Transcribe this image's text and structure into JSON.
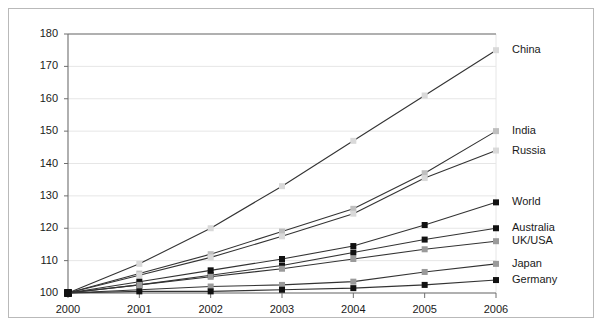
{
  "chart_data": {
    "type": "line",
    "title": "",
    "subtitle": "",
    "xlabel": "",
    "ylabel": "",
    "x": [
      2000,
      2001,
      2002,
      2003,
      2004,
      2005,
      2006
    ],
    "categories": [
      "2000",
      "2001",
      "2002",
      "2003",
      "2004",
      "2005",
      "2006"
    ],
    "xlim": [
      2000,
      2006
    ],
    "ylim": [
      100,
      180
    ],
    "yticks": [
      100,
      110,
      120,
      130,
      140,
      150,
      160,
      170,
      180
    ],
    "ytick_labels": [
      "100",
      "110",
      "120",
      "130",
      "140",
      "150",
      "160",
      "170",
      "180"
    ],
    "xtick_labels": [
      "2000",
      "2001",
      "2002",
      "2003",
      "2004",
      "2005",
      "2006"
    ],
    "grid": "horizontal",
    "legend_position": "right-inline-at-line-end",
    "marker": "square",
    "series": [
      {
        "name": "China",
        "label": "China",
        "color": "#333333",
        "marker_color": "#d9d9d9",
        "values": [
          100,
          109,
          120,
          133,
          147,
          161,
          175
        ]
      },
      {
        "name": "India",
        "label": "India",
        "color": "#333333",
        "marker_color": "#bfbfbf",
        "values": [
          100,
          106,
          112,
          119,
          126,
          137,
          150
        ]
      },
      {
        "name": "Russia",
        "label": "Russia",
        "color": "#333333",
        "marker_color": "#d9d9d9",
        "values": [
          100,
          105.5,
          111,
          117.5,
          124.5,
          135.5,
          144
        ]
      },
      {
        "name": "World",
        "label": "World",
        "color": "#333333",
        "marker_color": "#111111",
        "values": [
          100,
          103.5,
          107,
          110.5,
          114.5,
          121,
          128
        ]
      },
      {
        "name": "Australia",
        "label": "Australia",
        "color": "#333333",
        "marker_color": "#111111",
        "values": [
          100,
          102.5,
          105.5,
          108.5,
          112.5,
          116.5,
          120
        ]
      },
      {
        "name": "UK/USA",
        "label": "UK/USA",
        "color": "#333333",
        "marker_color": "#9a9a9a",
        "values": [
          100,
          102.5,
          105,
          107.5,
          110.5,
          113.5,
          116
        ]
      },
      {
        "name": "Japan",
        "label": "Japan",
        "color": "#333333",
        "marker_color": "#9a9a9a",
        "values": [
          100,
          101,
          102,
          102.5,
          103.5,
          106.5,
          109
        ]
      },
      {
        "name": "Germany",
        "label": "Germany",
        "color": "#333333",
        "marker_color": "#111111",
        "values": [
          100,
          100.5,
          100.5,
          101,
          101.5,
          102.5,
          104
        ]
      }
    ],
    "legend_y_positions": [
      {
        "name": "China",
        "value": 175
      },
      {
        "name": "India",
        "value": 150
      },
      {
        "name": "Russia",
        "value": 144
      },
      {
        "name": "World",
        "value": 128
      },
      {
        "name": "Australia",
        "value": 120
      },
      {
        "name": "UK/USA",
        "value": 116
      },
      {
        "name": "Japan",
        "value": 109
      },
      {
        "name": "Germany",
        "value": 104
      }
    ],
    "colors": {
      "axis": "#6e6e6e",
      "grid": "#e6e6e6",
      "line": "#333333",
      "frame": "#b9b9b9",
      "text": "#1a1a1a",
      "background": "#ffffff"
    }
  }
}
